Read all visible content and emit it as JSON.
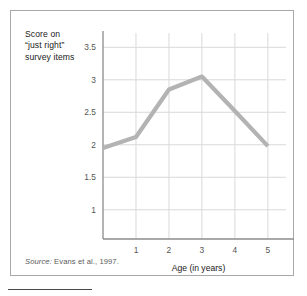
{
  "figure": {
    "y_axis_caption_lines": [
      "Score on",
      "“just right”",
      "survey items"
    ],
    "source_prefix": "Source:",
    "source_text": " Evans et al., 1997.",
    "border_color": "#a8a8a8",
    "rule_color": "#4a4a4a"
  },
  "chart_data": {
    "type": "line",
    "title": "",
    "xlabel": "Age (in years)",
    "ylabel": "Score on “just right” survey items",
    "x": [
      0,
      1,
      2,
      3,
      4,
      5
    ],
    "values": [
      1.95,
      2.12,
      2.85,
      3.05,
      2.52,
      1.98
    ],
    "series": [
      {
        "name": "Score on “just right” survey items",
        "x": [
          0,
          1,
          2,
          3,
          4,
          5
        ],
        "values": [
          1.95,
          2.12,
          2.85,
          3.05,
          2.52,
          1.98
        ],
        "color": "#b3b3b3"
      }
    ],
    "xlim": [
      0,
      5.55
    ],
    "ylim": [
      0.55,
      3.72
    ],
    "xticks": [
      1,
      2,
      3,
      4,
      5
    ],
    "xtick_labels": [
      "1",
      "2",
      "3",
      "4",
      "5"
    ],
    "yticks": [
      1,
      1.5,
      2,
      2.5,
      3,
      3.5
    ],
    "ytick_labels": [
      "1",
      "1.5",
      "2",
      "2.5",
      "3",
      "3.5"
    ],
    "grid": true,
    "grid_color": "#d9d9d9",
    "axis_color": "#8c8c8c",
    "legend": "none",
    "line_width": 4.2,
    "annotations": [
      "Source: Evans et al., 1997."
    ]
  }
}
